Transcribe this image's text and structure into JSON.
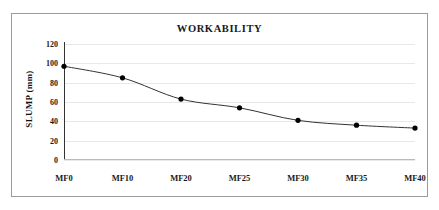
{
  "chart_data": {
    "type": "line",
    "title": "WORKABILITY",
    "xlabel": "",
    "ylabel": "SLUMP (mm)",
    "categories": [
      "MF0",
      "MF10",
      "MF20",
      "MF25",
      "MF30",
      "MF35",
      "MF40"
    ],
    "values": [
      97,
      85,
      63,
      54,
      41,
      36,
      33
    ],
    "ylim": [
      0,
      120
    ],
    "yticks": [
      0,
      20,
      40,
      60,
      80,
      100,
      120
    ],
    "ytick_labels": [
      "0",
      "20",
      "40",
      "60",
      "80",
      "100",
      "120"
    ],
    "grid": true,
    "legend": "none",
    "series": [
      {
        "name": "SLUMP",
        "values": [
          97,
          85,
          63,
          54,
          41,
          36,
          33
        ],
        "line_color": "#333333",
        "marker_color": "#000000",
        "marker": "circle"
      }
    ],
    "colors": {
      "line": "#333333",
      "marker": "#000000",
      "grid": "#e8e8e8",
      "axis": "#333333",
      "text": "#1a1a1a",
      "frame": "#9a9a9a",
      "background": "#ffffff"
    }
  }
}
